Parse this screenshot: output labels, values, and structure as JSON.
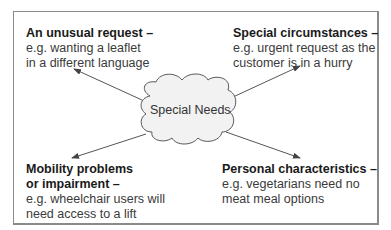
{
  "diagram": {
    "center": {
      "label": "Special Needs",
      "shape": "cloud",
      "fill": "#f2f2f2",
      "stroke": "#555555"
    },
    "blocks": [
      {
        "position": "top-left",
        "title_lines": [
          "An unusual request –"
        ],
        "desc_lines": [
          "e.g. wanting a leaflet",
          "in a different language"
        ]
      },
      {
        "position": "top-right",
        "title_lines": [
          "Special circumstances –"
        ],
        "desc_lines": [
          "e.g. urgent request as the",
          "customer is in a hurry"
        ]
      },
      {
        "position": "bottom-left",
        "title_lines": [
          "Mobility problems",
          "or impairment –"
        ],
        "desc_lines": [
          "e.g. wheelchair users will",
          "need access to a lift"
        ]
      },
      {
        "position": "bottom-right",
        "title_lines": [
          "Personal characteristics –"
        ],
        "desc_lines": [
          "e.g. vegetarians need no",
          "meat meal options"
        ]
      }
    ],
    "colors": {
      "border": "#8a8a8a",
      "arrow": "#444444",
      "text": "#333333"
    }
  }
}
